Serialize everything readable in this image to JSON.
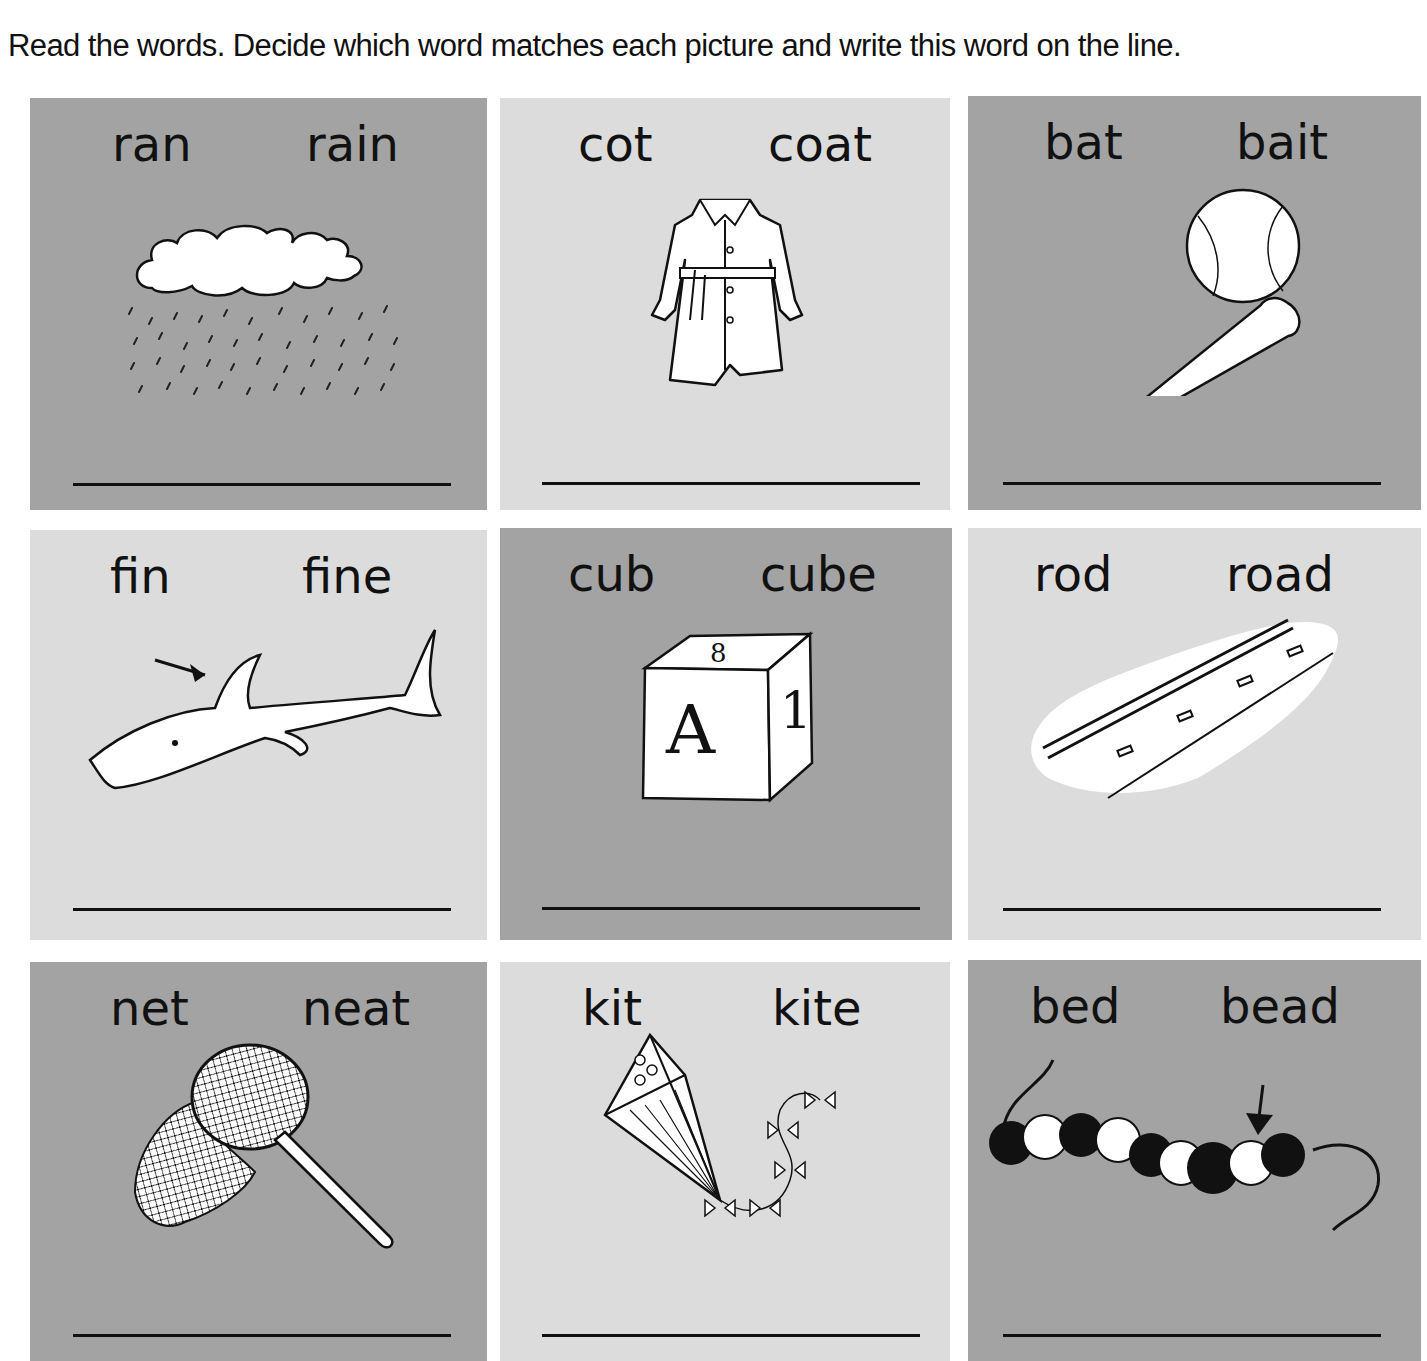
{
  "instructions": "Read the words. Decide which word matches each picture and write this word on the line.",
  "colors": {
    "dark_cell": "#a3a3a3",
    "light_cell": "#dcdcdc",
    "ink": "#111111"
  },
  "cells": [
    {
      "word1": "ran",
      "word2": "rain",
      "picture": "rain-cloud-icon",
      "shade": "dark",
      "answer": ""
    },
    {
      "word1": "cot",
      "word2": "coat",
      "picture": "coat-icon",
      "shade": "light",
      "answer": ""
    },
    {
      "word1": "bat",
      "word2": "bait",
      "picture": "baseball-bat-icon",
      "shade": "dark",
      "answer": ""
    },
    {
      "word1": "fin",
      "word2": "fine",
      "picture": "shark-fin-icon",
      "shade": "light",
      "answer": ""
    },
    {
      "word1": "cub",
      "word2": "cube",
      "picture": "toy-block-cube-icon",
      "shade": "dark",
      "answer": ""
    },
    {
      "word1": "rod",
      "word2": "road",
      "picture": "road-icon",
      "shade": "light",
      "answer": ""
    },
    {
      "word1": "net",
      "word2": "neat",
      "picture": "fishing-net-icon",
      "shade": "dark",
      "answer": ""
    },
    {
      "word1": "kit",
      "word2": "kite",
      "picture": "kite-icon",
      "shade": "light",
      "answer": ""
    },
    {
      "word1": "bed",
      "word2": "bead",
      "picture": "bead-string-icon",
      "shade": "dark",
      "answer": ""
    }
  ],
  "cube_letters": {
    "front": "A",
    "side": "1",
    "top": "8"
  }
}
